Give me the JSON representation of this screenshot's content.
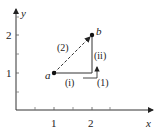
{
  "diagram": {
    "axes": {
      "x_label": "x",
      "y_label": "y",
      "x_ticks": [
        "1",
        "2"
      ],
      "y_ticks": [
        "1",
        "2"
      ]
    },
    "points": [
      {
        "label": "a",
        "x": 1,
        "y": 1
      },
      {
        "label": "b",
        "x": 2,
        "y": 2
      }
    ],
    "paths": [
      {
        "label": "(2)",
        "style": "dashed",
        "description": "straight line from a to b"
      },
      {
        "label": "(1)",
        "style": "solid",
        "description": "horizontal then vertical from a to b",
        "segments": [
          {
            "label": "(i)",
            "description": "horizontal from (1,1) to (2,1)"
          },
          {
            "label": "(ii)",
            "description": "vertical from (2,1) to (2,2)"
          }
        ]
      }
    ],
    "colors": {
      "line": "#222222",
      "background": "#ffffff"
    }
  }
}
